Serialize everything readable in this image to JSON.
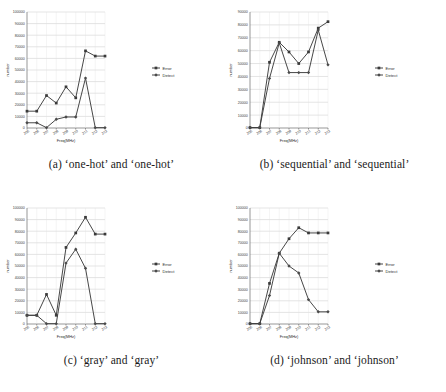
{
  "figure": {
    "series_names": [
      "Error",
      "Detect"
    ],
    "xlabel": "Freq(MHz)",
    "ylabel": "number",
    "categories": [
      "205",
      "206",
      "207",
      "208",
      "209",
      "210",
      "211",
      "212",
      "213"
    ]
  },
  "panels": [
    {
      "id": "a",
      "caption": "(a) ‘one-hot’ and ‘one-hot’",
      "chart_data": {
        "type": "line",
        "title": "(a) ‘one-hot’ and ‘one-hot’",
        "xlabel": "Freq(MHz)",
        "ylabel": "number",
        "categories": [
          "205",
          "206",
          "207",
          "208",
          "209",
          "210",
          "211",
          "212",
          "213"
        ],
        "ylim": [
          0,
          100000
        ],
        "ytick_step": 10000,
        "yticks": [
          "0",
          "10000",
          "20000",
          "30000",
          "40000",
          "50000",
          "60000",
          "70000",
          "80000",
          "90000",
          "100000"
        ],
        "grid": true,
        "legend_position": "right",
        "series": [
          {
            "name": "Error",
            "values": [
              14500,
              14500,
              28000,
              21500,
              35500,
              26000,
              66500,
              62000,
              62000
            ]
          },
          {
            "name": "Detect",
            "values": [
              4500,
              4500,
              300,
              7500,
              9500,
              9500,
              43000,
              300,
              300
            ]
          }
        ]
      }
    },
    {
      "id": "b",
      "caption": "(b) ‘sequential’ and ‘sequential’",
      "chart_data": {
        "type": "line",
        "title": "(b) ‘sequential’ and ‘sequential’",
        "xlabel": "Freq(MHz)",
        "ylabel": "number",
        "categories": [
          "205",
          "206",
          "207",
          "208",
          "209",
          "210",
          "211",
          "212",
          "213"
        ],
        "ylim": [
          0,
          90000
        ],
        "ytick_step": 10000,
        "yticks": [
          "0",
          "10000",
          "20000",
          "30000",
          "40000",
          "50000",
          "60000",
          "70000",
          "80000",
          "90000"
        ],
        "grid": true,
        "legend_position": "right",
        "series": [
          {
            "name": "Error",
            "values": [
              300,
              300,
              51000,
              66500,
              59000,
              50000,
              59000,
              77500,
              82500
            ]
          },
          {
            "name": "Detect",
            "values": [
              300,
              300,
              38500,
              66000,
              43000,
              43000,
              43000,
              76000,
              49000
            ]
          }
        ]
      }
    },
    {
      "id": "c",
      "caption": "(c) ‘gray’ and ‘gray’",
      "chart_data": {
        "type": "line",
        "title": "(c) ‘gray’ and ‘gray’",
        "xlabel": "Freq(MHz)",
        "ylabel": "number",
        "categories": [
          "205",
          "206",
          "207",
          "208",
          "209",
          "210",
          "211",
          "212",
          "213"
        ],
        "ylim": [
          0,
          100000
        ],
        "ytick_step": 10000,
        "yticks": [
          "0",
          "10000",
          "20000",
          "30000",
          "40000",
          "50000",
          "60000",
          "70000",
          "80000",
          "90000",
          "100000"
        ],
        "grid": true,
        "legend_position": "right",
        "series": [
          {
            "name": "Error",
            "values": [
              7500,
              7500,
              25500,
              7500,
              66000,
              78500,
              92000,
              77500,
              77500
            ]
          },
          {
            "name": "Detect",
            "values": [
              7500,
              7500,
              300,
              300,
              52500,
              64500,
              48000,
              300,
              300
            ]
          }
        ]
      }
    },
    {
      "id": "d",
      "caption": "(d) ‘johnson’ and ‘johnson’",
      "chart_data": {
        "type": "line",
        "title": "(d) ‘johnson’ and ‘johnson’",
        "xlabel": "Freq(MHz)",
        "ylabel": "number",
        "categories": [
          "205",
          "206",
          "207",
          "208",
          "209",
          "210",
          "211",
          "212",
          "213"
        ],
        "ylim": [
          0,
          100000
        ],
        "ytick_step": 10000,
        "yticks": [
          "0",
          "10000",
          "20000",
          "30000",
          "40000",
          "50000",
          "60000",
          "70000",
          "80000",
          "90000",
          "100000"
        ],
        "grid": true,
        "legend_position": "right",
        "series": [
          {
            "name": "Error",
            "values": [
              300,
              300,
              35000,
              61000,
              73500,
              83000,
              78500,
              78500,
              78500
            ]
          },
          {
            "name": "Detect",
            "values": [
              300,
              300,
              24500,
              61000,
              50000,
              44000,
              21000,
              10500,
              10500
            ]
          }
        ]
      }
    }
  ]
}
